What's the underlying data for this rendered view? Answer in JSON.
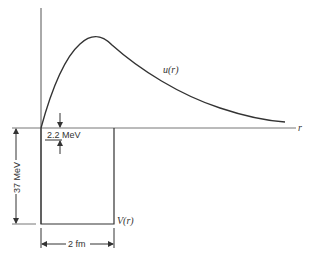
{
  "diagram": {
    "curve_label": "u(r)",
    "potential_label": "V(r)",
    "axis_label": "r",
    "binding_energy_label": "2.2 MeV",
    "well_depth_label": "37 MeV",
    "well_width_label": "2 fm"
  },
  "colors": {
    "line": "#333333",
    "axis": "#555555",
    "background": "#ffffff"
  }
}
